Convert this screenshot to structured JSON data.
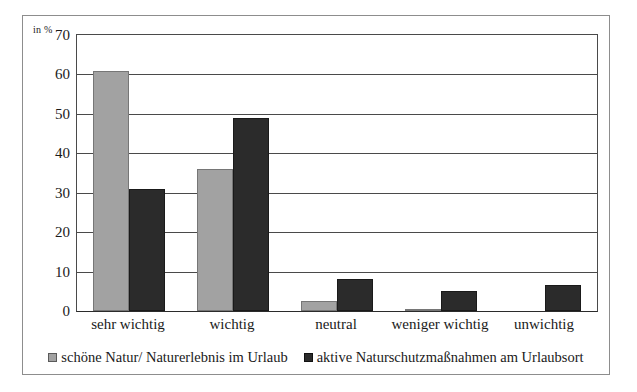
{
  "chart_data": {
    "type": "bar",
    "title": "",
    "subtitle": "",
    "xlabel": "",
    "ylabel": "in %",
    "ylim": [
      0,
      70
    ],
    "ytick_step": 10,
    "yticks": [
      "70",
      "60",
      "50",
      "40",
      "30",
      "20",
      "10",
      "0"
    ],
    "grid": true,
    "legend_position": "bottom",
    "categories": [
      "sehr wichtig",
      "wichtig",
      "neutral",
      "weniger wichtig",
      "unwichtig"
    ],
    "series": [
      {
        "name": "schöne Natur/ Naturerlebnis im Urlaub",
        "color": "#a2a2a2",
        "values": [
          61,
          36,
          2.5,
          0.5,
          0
        ]
      },
      {
        "name": "aktive Naturschutzmaßnahmen am Urlaubsort",
        "color": "#2b2b2b",
        "values": [
          31,
          49,
          8,
          5,
          6.5
        ]
      }
    ]
  },
  "axis": {
    "unit_label": "in %"
  },
  "legend": {
    "entries": [
      {
        "label": "schöne Natur/ Naturerlebnis im Urlaub",
        "swatch": "legend-swatch-gray"
      },
      {
        "label": "aktive Naturschutzmaßnahmen am Urlaubsort",
        "swatch": "legend-swatch-dark"
      }
    ]
  }
}
